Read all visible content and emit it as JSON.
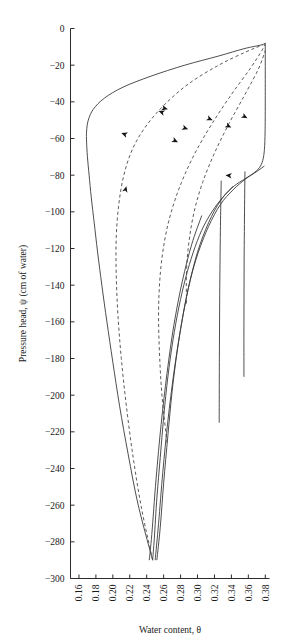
{
  "chart_data": {
    "type": "line",
    "title": "",
    "xlabel": "Water content, θ",
    "ylabel": "Pressure head, ψ (cm of water)",
    "xlim": [
      0.15,
      0.385
    ],
    "ylim": [
      -300,
      0
    ],
    "grid": false,
    "legend": null,
    "xticks": [
      "0.16",
      "0.18",
      "0.20",
      "0.22",
      "0.24",
      "0.26",
      "0.28",
      "0.30",
      "0.32",
      "0.34",
      "0.36",
      "0.38"
    ],
    "xtick_values": [
      0.16,
      0.18,
      0.2,
      0.22,
      0.24,
      0.26,
      0.28,
      0.3,
      0.32,
      0.34,
      0.36,
      0.38
    ],
    "yticks": [
      "−300",
      "−280",
      "−260",
      "−240",
      "−220",
      "−200",
      "−180",
      "−160",
      "−140",
      "−120",
      "−100",
      "−80",
      "−60",
      "−40",
      "−20",
      "0"
    ],
    "ytick_values": [
      -300,
      -280,
      -260,
      -240,
      -220,
      -200,
      -180,
      -160,
      -140,
      -120,
      -100,
      -80,
      -60,
      -40,
      -20,
      0
    ],
    "series": [
      {
        "name": "main-drying-curve",
        "style": "solid",
        "direction": "drying",
        "points": [
          [
            0.38,
            -8
          ],
          [
            0.38,
            -40
          ],
          [
            0.3798,
            -56
          ],
          [
            0.379,
            -66
          ],
          [
            0.377,
            -72
          ],
          [
            0.373,
            -76
          ],
          [
            0.366,
            -79
          ],
          [
            0.356,
            -82
          ],
          [
            0.343,
            -86
          ],
          [
            0.33,
            -92
          ],
          [
            0.317,
            -100
          ],
          [
            0.305,
            -110
          ],
          [
            0.295,
            -122
          ],
          [
            0.286,
            -136
          ],
          [
            0.278,
            -152
          ],
          [
            0.271,
            -170
          ],
          [
            0.265,
            -190
          ],
          [
            0.26,
            -212
          ],
          [
            0.256,
            -234
          ],
          [
            0.252,
            -256
          ],
          [
            0.249,
            -278
          ],
          [
            0.247,
            -290
          ]
        ]
      },
      {
        "name": "main-wetting-curve",
        "style": "solid",
        "direction": "wetting",
        "points": [
          [
            0.247,
            -290
          ],
          [
            0.23,
            -260
          ],
          [
            0.218,
            -232
          ],
          [
            0.208,
            -206
          ],
          [
            0.2,
            -182
          ],
          [
            0.193,
            -160
          ],
          [
            0.187,
            -140
          ],
          [
            0.182,
            -122
          ],
          [
            0.178,
            -106
          ],
          [
            0.1745,
            -92
          ],
          [
            0.172,
            -80
          ],
          [
            0.17,
            -70
          ],
          [
            0.169,
            -62
          ],
          [
            0.169,
            -56
          ],
          [
            0.171,
            -50
          ],
          [
            0.177,
            -44
          ],
          [
            0.19,
            -38
          ],
          [
            0.212,
            -32
          ],
          [
            0.245,
            -26
          ],
          [
            0.285,
            -20
          ],
          [
            0.325,
            -15
          ],
          [
            0.355,
            -11
          ],
          [
            0.375,
            -9
          ],
          [
            0.38,
            -8
          ]
        ]
      },
      {
        "name": "drying-scanning-curve-1",
        "style": "solid",
        "direction": "drying",
        "points": [
          [
            0.379,
            -75
          ],
          [
            0.37,
            -78
          ],
          [
            0.357,
            -82
          ],
          [
            0.342,
            -88
          ],
          [
            0.327,
            -96
          ],
          [
            0.313,
            -108
          ],
          [
            0.301,
            -122
          ],
          [
            0.291,
            -138
          ],
          [
            0.283,
            -156
          ],
          [
            0.276,
            -176
          ],
          [
            0.27,
            -198
          ],
          [
            0.265,
            -222
          ],
          [
            0.26,
            -248
          ],
          [
            0.256,
            -272
          ],
          [
            0.252,
            -290
          ]
        ]
      },
      {
        "name": "drying-scanning-curve-2",
        "style": "solid",
        "direction": "drying",
        "points": [
          [
            0.342,
            -86
          ],
          [
            0.327,
            -94
          ],
          [
            0.313,
            -106
          ],
          [
            0.3,
            -122
          ],
          [
            0.289,
            -142
          ],
          [
            0.28,
            -164
          ],
          [
            0.272,
            -188
          ],
          [
            0.265,
            -214
          ],
          [
            0.259,
            -242
          ],
          [
            0.254,
            -270
          ],
          [
            0.25,
            -290
          ]
        ]
      },
      {
        "name": "drying-scanning-curve-3",
        "style": "solid",
        "direction": "drying",
        "points": [
          [
            0.305,
            -102
          ],
          [
            0.293,
            -118
          ],
          [
            0.282,
            -138
          ],
          [
            0.272,
            -162
          ],
          [
            0.264,
            -188
          ],
          [
            0.257,
            -216
          ],
          [
            0.251,
            -246
          ],
          [
            0.246,
            -276
          ],
          [
            0.243,
            -290
          ]
        ]
      },
      {
        "name": "wetting-scanning-curve-1",
        "style": "dashed",
        "direction": "wetting",
        "points": [
          [
            0.247,
            -290
          ],
          [
            0.234,
            -262
          ],
          [
            0.224,
            -234
          ],
          [
            0.216,
            -206
          ],
          [
            0.21,
            -180
          ],
          [
            0.206,
            -156
          ],
          [
            0.204,
            -134
          ],
          [
            0.204,
            -114
          ],
          [
            0.207,
            -96
          ],
          [
            0.213,
            -80
          ],
          [
            0.223,
            -66
          ],
          [
            0.238,
            -54
          ],
          [
            0.26,
            -42
          ],
          [
            0.29,
            -30
          ],
          [
            0.325,
            -20
          ],
          [
            0.356,
            -13
          ],
          [
            0.377,
            -9
          ]
        ]
      },
      {
        "name": "wetting-scanning-curve-2",
        "style": "dashed",
        "direction": "wetting",
        "points": [
          [
            0.264,
            -226
          ],
          [
            0.258,
            -200
          ],
          [
            0.255,
            -176
          ],
          [
            0.254,
            -154
          ],
          [
            0.256,
            -134
          ],
          [
            0.261,
            -116
          ],
          [
            0.269,
            -100
          ],
          [
            0.281,
            -84
          ],
          [
            0.297,
            -68
          ],
          [
            0.317,
            -52
          ],
          [
            0.34,
            -36
          ],
          [
            0.362,
            -22
          ],
          [
            0.376,
            -12
          ],
          [
            0.38,
            -8
          ]
        ]
      },
      {
        "name": "wetting-scanning-curve-3",
        "style": "dashed",
        "direction": "wetting",
        "points": [
          [
            0.287,
            -150
          ],
          [
            0.287,
            -132
          ],
          [
            0.29,
            -116
          ],
          [
            0.296,
            -100
          ],
          [
            0.306,
            -84
          ],
          [
            0.32,
            -68
          ],
          [
            0.337,
            -52
          ],
          [
            0.356,
            -36
          ],
          [
            0.372,
            -22
          ],
          [
            0.38,
            -12
          ]
        ]
      },
      {
        "name": "vertical-drying-segment-1",
        "style": "solid",
        "direction": "drying",
        "points": [
          [
            0.356,
            -78
          ],
          [
            0.3555,
            -100
          ],
          [
            0.355,
            -130
          ],
          [
            0.3548,
            -160
          ],
          [
            0.3548,
            -190
          ]
        ]
      },
      {
        "name": "vertical-drying-segment-2",
        "style": "solid",
        "direction": "drying",
        "points": [
          [
            0.328,
            -83
          ],
          [
            0.327,
            -110
          ],
          [
            0.3262,
            -145
          ],
          [
            0.3258,
            -180
          ],
          [
            0.3256,
            -215
          ]
        ]
      }
    ],
    "arrows": [
      {
        "name": "arrow-wetting-1",
        "x": 0.216,
        "y": -86,
        "direction": "up",
        "angle": -75
      },
      {
        "name": "arrow-drying-1",
        "x": 0.21,
        "y": -57,
        "direction": "down-left",
        "angle": 200
      },
      {
        "name": "arrow-drying-2",
        "x": 0.254,
        "y": -45,
        "direction": "down-left",
        "angle": 200
      },
      {
        "name": "arrow-wetting-2",
        "x": 0.265,
        "y": -44,
        "direction": "right",
        "angle": 15
      },
      {
        "name": "arrow-wetting-3",
        "x": 0.277,
        "y": -62,
        "direction": "right",
        "angle": 25
      },
      {
        "name": "arrow-wetting-4",
        "x": 0.289,
        "y": -55,
        "direction": "right",
        "angle": 20
      },
      {
        "name": "arrow-drying-3",
        "x": 0.333,
        "y": -80,
        "direction": "left",
        "angle": 185
      },
      {
        "name": "arrow-wetting-5",
        "x": 0.318,
        "y": -50,
        "direction": "right",
        "angle": 22
      },
      {
        "name": "arrow-wetting-6",
        "x": 0.34,
        "y": -54,
        "direction": "right",
        "angle": 25
      },
      {
        "name": "arrow-wetting-7",
        "x": 0.359,
        "y": -49,
        "direction": "right",
        "angle": 30
      }
    ]
  }
}
